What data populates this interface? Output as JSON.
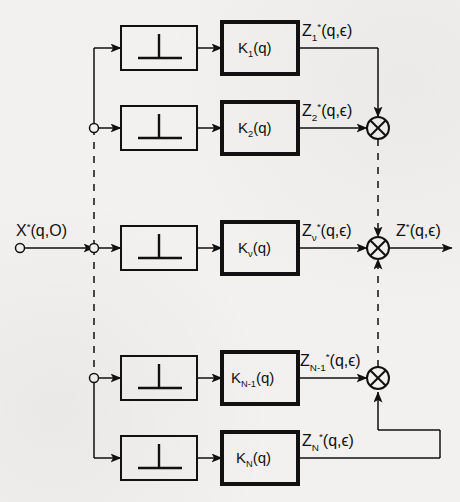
{
  "figure": {
    "type": "signal-flow block diagram",
    "background_color": "#f2f1ef",
    "ink_color": "#111111"
  },
  "input": {
    "terminal_name": "input-terminal",
    "label_parts": {
      "base": "X",
      "sup": "*",
      "args": "(q,O)"
    },
    "label_text": "X*(q,O)"
  },
  "output": {
    "terminal_name": "output-arrow",
    "label_parts": {
      "base": "Z",
      "sup": "*",
      "args": "(q,ϵ)"
    },
    "label_text": "Z*(q,ϵ)"
  },
  "sampler": {
    "glyph_name": "sampler-impulse-glyph",
    "glyph_description": "inverted-T impulse sampler symbol"
  },
  "channels": [
    {
      "id": "channel-1",
      "row_y": 48,
      "sampler_label": "",
      "block_parts": {
        "base": "K",
        "sub": "1",
        "args": "(q)"
      },
      "block_text": "K₁(q)",
      "signal_parts": {
        "base": "Z",
        "sub": "1",
        "sup": "*",
        "args": "(q,ϵ)"
      },
      "signal_text": "Z₁*(q,ϵ)",
      "routing": "right-then-down"
    },
    {
      "id": "channel-2",
      "row_y": 128,
      "sampler_label": "",
      "block_parts": {
        "base": "K",
        "sub": "2",
        "args": "(q)"
      },
      "block_text": "K₂(q)",
      "signal_parts": {
        "base": "Z",
        "sub": "2",
        "sup": "*",
        "args": "(q,ϵ)"
      },
      "signal_text": "Z₂*(q,ϵ)",
      "routing": "straight-into-junction"
    },
    {
      "id": "channel-nu",
      "row_y": 248,
      "sampler_label": "",
      "block_parts": {
        "base": "K",
        "sub": "ν",
        "args": "(q)"
      },
      "block_text": "Kν(q)",
      "signal_parts": {
        "base": "Z",
        "sub": "ν",
        "sup": "*",
        "args": "(q,ϵ)"
      },
      "signal_text": "Zν*(q,ϵ)",
      "routing": "straight-into-junction"
    },
    {
      "id": "channel-n-minus-1",
      "row_y": 378,
      "sampler_label": "",
      "block_parts": {
        "base": "K",
        "sub": "N-1",
        "args": "(q)"
      },
      "block_text": "Kₙ₋₁(q)",
      "signal_parts": {
        "base": "Z",
        "sub": "N-1",
        "sup": "*",
        "args": "(q,ϵ)"
      },
      "signal_text": "Zₙ₋₁*(q,ϵ)",
      "routing": "straight-into-junction"
    },
    {
      "id": "channel-n",
      "row_y": 458,
      "sampler_label": "",
      "block_parts": {
        "base": "K",
        "sub": "N",
        "args": "(q)"
      },
      "block_text": "Kₙ(q)",
      "signal_parts": {
        "base": "Z",
        "sub": "N",
        "sup": "*",
        "args": "(q,ϵ)"
      },
      "signal_text": "Zₙ*(q,ϵ)",
      "routing": "right-then-up"
    }
  ],
  "summing_junctions": [
    {
      "id": "sum-top",
      "x": 378,
      "y": 128,
      "symbol": "crossed-circle"
    },
    {
      "id": "sum-middle",
      "x": 378,
      "y": 248,
      "symbol": "crossed-circle"
    },
    {
      "id": "sum-bottom",
      "x": 378,
      "y": 378,
      "symbol": "crossed-circle"
    }
  ],
  "buses": {
    "input_bus_x": 94,
    "sum_bus_x": 378,
    "dashed_note": "dashed segments denote omitted intermediate channels"
  }
}
